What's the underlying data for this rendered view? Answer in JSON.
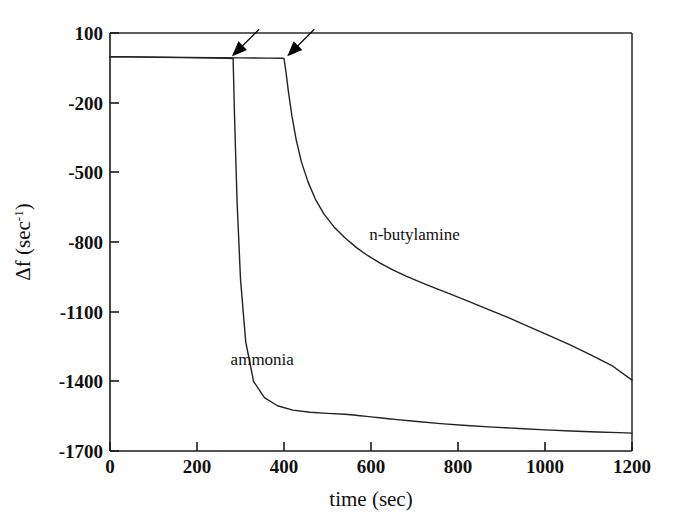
{
  "chart_data": {
    "type": "line",
    "title": "",
    "xlabel": "time (sec)",
    "ylabel": "Δf (sec",
    "ylabel_sup": "-1",
    "ylabel_close": ")",
    "xlim": [
      0,
      1200
    ],
    "ylim": [
      -1700,
      100
    ],
    "xticks": [
      0,
      200,
      400,
      600,
      800,
      1000,
      1200
    ],
    "yticks": [
      100,
      -200,
      -500,
      -800,
      -1100,
      -1400,
      -1700
    ],
    "xtick_labels": [
      "0",
      "200",
      "400",
      "600",
      "800",
      "1000",
      "1200"
    ],
    "ytick_labels": [
      "100",
      "-200",
      "-500",
      "-800",
      "-1100",
      "-1400",
      "-1700"
    ],
    "grid": false,
    "legend_position": "inline-annotations",
    "baseline_value": 0,
    "series": [
      {
        "name": "ammonia",
        "label": "ammonia",
        "label_x": 350,
        "label_y": -1330,
        "injection_time": 283,
        "x": [
          0,
          40,
          80,
          120,
          160,
          200,
          240,
          270,
          283,
          286,
          292,
          300,
          312,
          330,
          355,
          385,
          420,
          460,
          500,
          540,
          560,
          575,
          590,
          605,
          620,
          640,
          660,
          700,
          760,
          820,
          880,
          940,
          1000,
          1060,
          1120,
          1170,
          1200
        ],
        "y": [
          -2,
          -3,
          -4,
          -5,
          -6,
          -7,
          -8,
          -9,
          -10,
          -240,
          -620,
          -960,
          -1230,
          -1400,
          -1470,
          -1505,
          -1524,
          -1533,
          -1538,
          -1542,
          -1545,
          -1548,
          -1551,
          -1554,
          -1557,
          -1561,
          -1565,
          -1572,
          -1582,
          -1590,
          -1597,
          -1603,
          -1609,
          -1614,
          -1618,
          -1621,
          -1623
        ]
      },
      {
        "name": "n-butylamine",
        "label": "n-butylamine",
        "label_x": 700,
        "label_y": -790,
        "injection_time": 400,
        "x": [
          0,
          60,
          120,
          180,
          240,
          300,
          360,
          395,
          400,
          404,
          410,
          418,
          428,
          440,
          455,
          472,
          492,
          515,
          540,
          566,
          592,
          620,
          650,
          682,
          716,
          752,
          790,
          830,
          872,
          916,
          960,
          1006,
          1054,
          1104,
          1156,
          1200
        ],
        "y": [
          -2,
          -3,
          -4,
          -5,
          -6,
          -7,
          -8,
          -9,
          -10,
          -60,
          -150,
          -255,
          -360,
          -455,
          -540,
          -615,
          -680,
          -735,
          -782,
          -823,
          -858,
          -890,
          -920,
          -948,
          -975,
          -1002,
          -1030,
          -1060,
          -1092,
          -1126,
          -1162,
          -1200,
          -1240,
          -1285,
          -1335,
          -1395
        ]
      }
    ],
    "annotations": [
      {
        "name": "arrow-ammonia-injection",
        "points_to_x": 283,
        "points_to_y": 0,
        "direction": "down-left",
        "description": "arrow marking ammonia injection"
      },
      {
        "name": "arrow-butylamine-injection",
        "points_to_x": 410,
        "points_to_y": 0,
        "direction": "down-left",
        "description": "arrow marking n-butylamine injection"
      }
    ],
    "colors": {
      "line": "#222222",
      "axis": "#1a1a1a",
      "background": "#ffffff",
      "text": "#111111"
    }
  }
}
